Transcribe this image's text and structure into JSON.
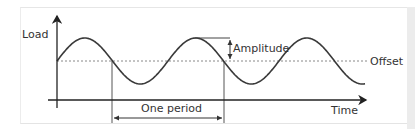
{
  "diagram": {
    "y_axis_label": "Load",
    "x_axis_label": "Time",
    "offset_label": "Offset",
    "amplitude_label": "Amplitude",
    "period_label": "One period",
    "colors": {
      "curve": "#3a3a3a",
      "axes": "#222222",
      "offset_line": "#888888",
      "markers": "#444444",
      "text": "#333333",
      "frame_border": "#e6e6e6",
      "side_strip": "#ececec"
    },
    "wave": {
      "type": "sine",
      "offset_y": 61,
      "amplitude_px": 23,
      "period_px": 111,
      "start_x": 57,
      "end_x": 365
    }
  }
}
